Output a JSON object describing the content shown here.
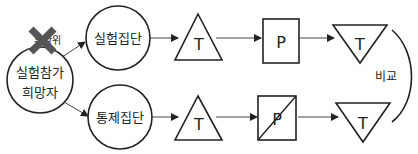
{
  "diagram": {
    "source_node": {
      "line1": "실험참가",
      "line2": "희망자"
    },
    "random_label": "무작위",
    "random_crossed": true,
    "groups": [
      {
        "name": "실험집단",
        "pretest": "T",
        "treatment": "P",
        "treatment_withheld": false,
        "posttest": "T"
      },
      {
        "name": "통제집단",
        "pretest": "T",
        "treatment": "P",
        "treatment_withheld": true,
        "posttest": "T"
      }
    ],
    "compare_label": "비교",
    "colors": {
      "stroke": "#222222",
      "cross": "#555555",
      "background": "#ffffff"
    }
  }
}
